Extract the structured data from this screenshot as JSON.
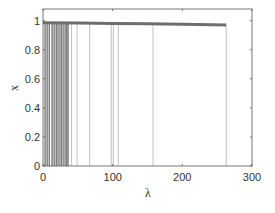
{
  "chart_data": {
    "type": "line",
    "title": "",
    "xlabel": "λ",
    "ylabel": "x",
    "xlim": [
      0,
      300
    ],
    "ylim": [
      0,
      1.08
    ],
    "xticks": [
      0,
      100,
      200,
      300
    ],
    "xtick_labels": [
      "0",
      "100",
      "200",
      "300"
    ],
    "yticks": [
      0,
      0.2,
      0.4,
      0.6,
      0.8,
      1
    ],
    "ytick_labels": [
      "0",
      "0.2",
      "0.4",
      "0.6",
      "0.8",
      "1"
    ],
    "grid": false,
    "box": true,
    "legend": null,
    "series": [
      {
        "name": "x(λ) trajectory",
        "style": "thick dark gray line",
        "color": "#6e6e6e",
        "x": [
          0,
          50,
          100,
          150,
          200,
          263
        ],
        "y": [
          0.985,
          0.983,
          0.98,
          0.978,
          0.975,
          0.97
        ]
      },
      {
        "name": "vertical drops to x=0",
        "style": "thin gray vertical lines",
        "color": "#9a9a9a",
        "lambda_positions": [
          3,
          6,
          9,
          13,
          16,
          19,
          20,
          23,
          26,
          27,
          30,
          33,
          34,
          36,
          41,
          49,
          67,
          98,
          101,
          108,
          158,
          263
        ],
        "y_top": 0.98,
        "y_bottom": 0
      }
    ]
  },
  "labels": {
    "xlabel": "λ",
    "ylabel": "x",
    "x0": "0",
    "x1": "100",
    "x2": "200",
    "x3": "300",
    "y0": "0",
    "y1": "0.2",
    "y2": "0.4",
    "y3": "0.6",
    "y4": "0.8",
    "y5": "1"
  }
}
